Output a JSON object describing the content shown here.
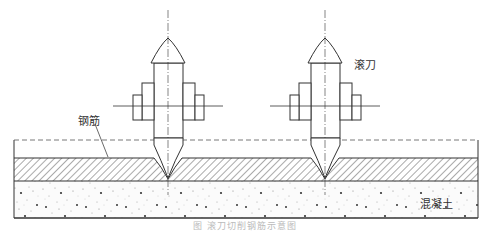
{
  "labels": {
    "rebar": "钢筋",
    "cutter": "滚刀",
    "concrete": "混凝土"
  },
  "caption": "图 滚刀切削钢筋示意图",
  "colors": {
    "line": "#333333",
    "hatch": "#555555",
    "concrete_speckle": "#444444",
    "background": "#ffffff"
  },
  "geometry": {
    "cutters_center_x": [
      168,
      325
    ],
    "dashed_surface_y": 140,
    "rebar_layer_top_y": 158,
    "rebar_layer_bottom_y": 181,
    "concrete_bottom_y": 218,
    "box_left_x": 14,
    "box_right_x": 478
  }
}
